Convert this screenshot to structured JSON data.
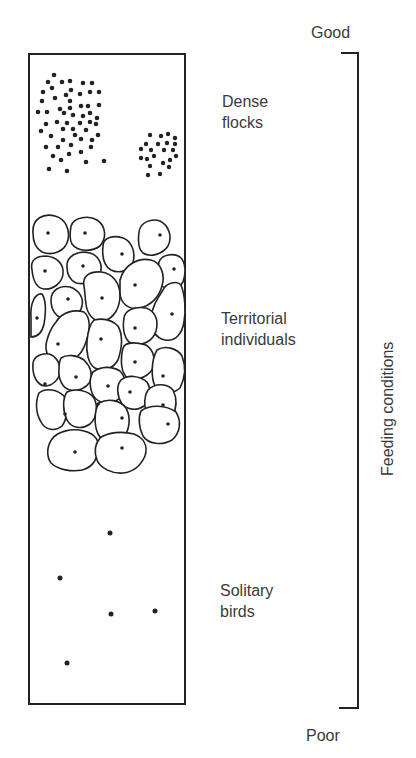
{
  "diagram": {
    "type": "zoned-column",
    "axis": {
      "label": "Feeding conditions",
      "top_label": "Good",
      "bottom_label": "Poor"
    },
    "zones": [
      {
        "id": "dense",
        "label_line1": "Dense",
        "label_line2": "flocks",
        "depiction": "clustered dots (two flocks)"
      },
      {
        "id": "territorial",
        "label_line1": "Territorial",
        "label_line2": "individuals",
        "depiction": "tessellated territories, one bird each"
      },
      {
        "id": "solitary",
        "label_line1": "Solitary",
        "label_line2": "birds",
        "depiction": "sparse scattered dots"
      }
    ],
    "colors": {
      "line": "#222222",
      "text": "#3a3a3a",
      "background": "#ffffff"
    }
  }
}
